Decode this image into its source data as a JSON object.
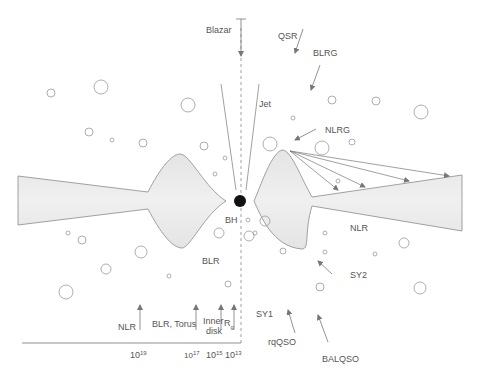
{
  "labels": {
    "blazar": "Blazar",
    "qsr": "QSR",
    "blrg": "BLRG",
    "jet": "Jet",
    "nlrg": "NLRG",
    "bh": "BH",
    "nlr_right": "NLR",
    "blr": "BLR",
    "sy2": "SY2",
    "sy1": "SY1",
    "rqqso": "rqQSO",
    "balqso": "BALQSO",
    "scale_nlr": "NLR",
    "scale_blr_torus": "BLR, Torus",
    "scale_inner": "Inner",
    "scale_disk": "disk",
    "scale_rg_main": "R",
    "scale_rg_sub": "g"
  },
  "axis": {
    "ticks": [
      {
        "base": "10",
        "exp": "19"
      },
      {
        "base": "10",
        "exp": "17"
      },
      {
        "base": "10",
        "exp": "15"
      },
      {
        "base": "10",
        "exp": "13"
      }
    ]
  },
  "colors": {
    "stroke": "#8a8a8a",
    "fill": "#e6e6e6",
    "black_hole": "#111111",
    "text": "#555555"
  }
}
